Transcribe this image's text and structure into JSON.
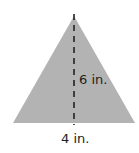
{
  "figure": {
    "shape": "triangle",
    "fill_color": "#b3b3b3",
    "height_label": "6 in.",
    "base_label": "4 in.",
    "height_line_style": "dashed"
  }
}
